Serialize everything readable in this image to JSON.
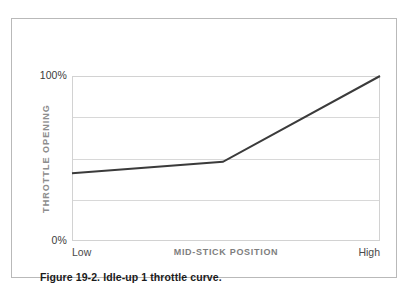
{
  "figure": {
    "caption": "Figure 19-2. Idle-up 1 throttle curve.",
    "border_color": "#b9b9b9",
    "background": "#ffffff"
  },
  "chart_data": {
    "type": "line",
    "title": "",
    "xlabel": "MID-STICK POSITION",
    "ylabel": "THROTTLE OPENING",
    "x_tick_labels": [
      "Low",
      "High"
    ],
    "y_tick_labels": [
      "100%",
      "0%"
    ],
    "xlim": [
      0,
      100
    ],
    "ylim": [
      0,
      100
    ],
    "grid": true,
    "gridline_count": 5,
    "gridline_values": [
      100,
      75,
      50,
      25,
      0
    ],
    "legend": null,
    "series": [
      {
        "name": "Idle-up 1 throttle curve",
        "color": "#3b3b3b",
        "line_width": 2,
        "x": [
          0,
          49,
          100
        ],
        "y": [
          41,
          48,
          100
        ]
      }
    ],
    "annotations": []
  },
  "style": {
    "curve_color": "#3b3b3b",
    "gridline_color": "#d8d8d8",
    "plot_border_color": "#d2d2d2",
    "axis_title_color": "#8d8d8d",
    "tick_label_color": "#3a3a3a"
  }
}
